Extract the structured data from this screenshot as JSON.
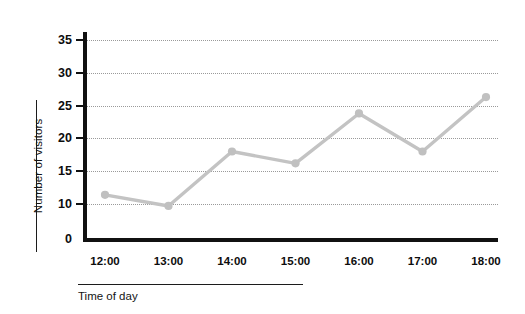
{
  "chart_data": {
    "type": "line",
    "title": "",
    "subtitle": "",
    "xlabel": "Time of day",
    "ylabel": "Number of visitors",
    "categories": [
      "12:00",
      "13:00",
      "14:00",
      "15:00",
      "16:00",
      "17:00",
      "18:00"
    ],
    "values": [
      11.4,
      9.7,
      18.0,
      16.2,
      23.8,
      18.0,
      26.3
    ],
    "series": [
      {
        "name": "Number of visitors",
        "values": [
          11.4,
          9.7,
          18.0,
          16.2,
          23.8,
          18.0,
          26.3
        ]
      }
    ],
    "ylim": [
      0,
      35
    ],
    "y_ticks": [
      0,
      10,
      15,
      20,
      25,
      30,
      35
    ],
    "y_tick_labels": [
      "0",
      "10",
      "15",
      "20",
      "25",
      "30",
      "35"
    ],
    "gridline_values": [
      10,
      15,
      20,
      25,
      30,
      35
    ],
    "grid": true,
    "grid_style": "dotted-horizontal",
    "legend": false,
    "legend_position": "none",
    "marker": "circle",
    "line_color": "#c3c3c3",
    "marker_color": "#c0c0c0",
    "axis_color": "#111111",
    "grid_color": "#9a9a9a",
    "background_color": "#ffffff",
    "annotations": []
  },
  "axes": {
    "y": {
      "title": "Number of visitors",
      "ticks": [
        {
          "label": "35",
          "value": 35
        },
        {
          "label": "30",
          "value": 30
        },
        {
          "label": "25",
          "value": 25
        },
        {
          "label": "20",
          "value": 20
        },
        {
          "label": "15",
          "value": 15
        },
        {
          "label": "10",
          "value": 10
        },
        {
          "label": "0",
          "value": 0
        }
      ]
    },
    "x": {
      "title": "Time of day",
      "ticks": [
        {
          "label": "12:00"
        },
        {
          "label": "13:00"
        },
        {
          "label": "14:00"
        },
        {
          "label": "15:00"
        },
        {
          "label": "16:00"
        },
        {
          "label": "17:00"
        },
        {
          "label": "18:00"
        }
      ]
    }
  }
}
